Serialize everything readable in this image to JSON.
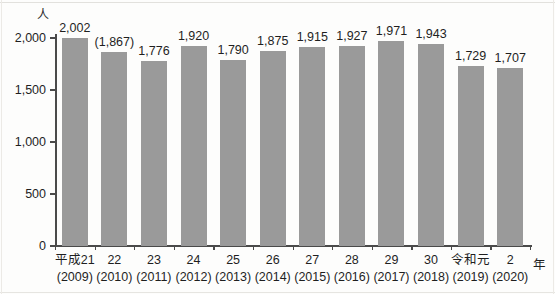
{
  "chart_data": {
    "type": "bar",
    "title": "",
    "xlabel": "年",
    "ylabel": "人",
    "unit_label": "人",
    "year_suffix": "年",
    "ylim": [
      0,
      2000
    ],
    "grid": false,
    "legend": "none",
    "y_ticks": [
      {
        "value": 0,
        "label": "0"
      },
      {
        "value": 500,
        "label": "500"
      },
      {
        "value": 1000,
        "label": "1,000"
      },
      {
        "value": 1500,
        "label": "1,500"
      },
      {
        "value": 2000,
        "label": "2,000"
      }
    ],
    "categories": [
      {
        "era": "平成21",
        "year": "(2009)"
      },
      {
        "era": "22",
        "year": "(2010)"
      },
      {
        "era": "23",
        "year": "(2011)"
      },
      {
        "era": "24",
        "year": "(2012)"
      },
      {
        "era": "25",
        "year": "(2013)"
      },
      {
        "era": "26",
        "year": "(2014)"
      },
      {
        "era": "27",
        "year": "(2015)"
      },
      {
        "era": "28",
        "year": "(2016)"
      },
      {
        "era": "29",
        "year": "(2017)"
      },
      {
        "era": "30",
        "year": "(2018)"
      },
      {
        "era": "令和元",
        "year": "(2019)"
      },
      {
        "era": "2",
        "year": "(2020)"
      }
    ],
    "values": [
      2002,
      1867,
      1776,
      1920,
      1790,
      1875,
      1915,
      1927,
      1971,
      1943,
      1729,
      1707
    ],
    "value_labels": [
      "2,002",
      "(1,867)",
      "1,776",
      "1,920",
      "1,790",
      "1,875",
      "1,915",
      "1,927",
      "1,971",
      "1,943",
      "1,729",
      "1,707"
    ],
    "bar_color": "#9a9a9a",
    "axis_color": "#4a4a4a",
    "text_color": "#1f1f1f"
  }
}
